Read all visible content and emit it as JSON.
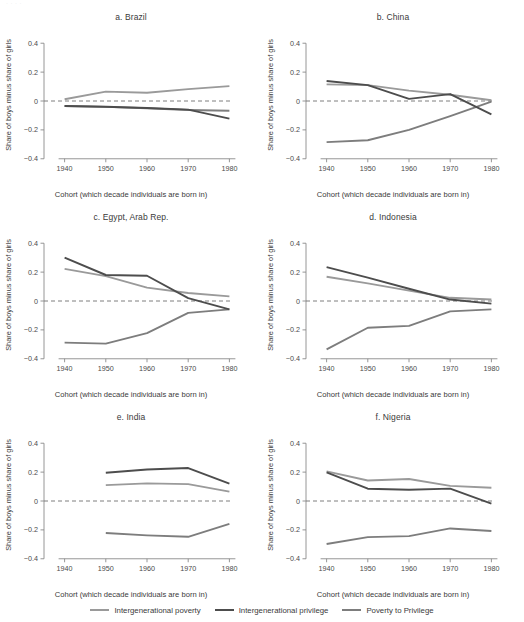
{
  "figure": {
    "top_remnant": "·  ·   ·   ·",
    "xlabel": "Cohort (which decade individuals are born in)",
    "ylabel": "Share of boys minus share of girls",
    "yticks": [
      "0.4",
      "0.2",
      "0",
      "−0.2",
      "−0.4"
    ],
    "ytick_values": [
      0.4,
      0.2,
      0,
      -0.2,
      -0.4
    ],
    "xticks": [
      "1940",
      "1950",
      "1960",
      "1970",
      "1980"
    ],
    "xtick_values": [
      1940,
      1950,
      1960,
      1970,
      1980
    ]
  },
  "legend": {
    "position": "bottom-center",
    "items": [
      {
        "label": "Intergenerational poverty",
        "color": "#9a9a9a"
      },
      {
        "label": "Intergenerational privilege",
        "color": "#4d4d4d"
      },
      {
        "label": "Poverty to Privilege",
        "color": "#7d7d7d"
      }
    ]
  },
  "chart_data": [
    {
      "type": "line",
      "title": "a. Brazil",
      "xlabel": "Cohort (which decade individuals are born in)",
      "ylabel": "Share of boys minus share of girls",
      "x": [
        1940,
        1950,
        1960,
        1970,
        1980
      ],
      "xlim": [
        1935,
        1985
      ],
      "ylim": [
        -0.45,
        0.45
      ],
      "grid": false,
      "zero_reference_line": 0,
      "series": [
        {
          "name": "Intergenerational poverty",
          "color": "#9a9a9a",
          "values": [
            0.012,
            0.065,
            0.057,
            0.082,
            0.103
          ]
        },
        {
          "name": "Intergenerational privilege",
          "color": "#4d4d4d",
          "values": [
            -0.035,
            -0.04,
            -0.048,
            -0.06,
            -0.122
          ]
        },
        {
          "name": "Poverty to Privilege",
          "color": "#7d7d7d",
          "values": [
            -0.035,
            -0.041,
            -0.05,
            -0.062,
            -0.068
          ]
        }
      ]
    },
    {
      "type": "line",
      "title": "b. China",
      "xlabel": "Cohort (which decade individuals are born in)",
      "ylabel": "Share of boys minus share of girls",
      "x": [
        1940,
        1950,
        1960,
        1970,
        1980
      ],
      "xlim": [
        1935,
        1985
      ],
      "ylim": [
        -0.45,
        0.45
      ],
      "grid": false,
      "zero_reference_line": 0,
      "series": [
        {
          "name": "Intergenerational poverty",
          "color": "#9a9a9a",
          "values": [
            0.115,
            0.11,
            0.072,
            0.043,
            0.005
          ]
        },
        {
          "name": "Intergenerational privilege",
          "color": "#4d4d4d",
          "values": [
            0.138,
            0.11,
            0.015,
            0.048,
            -0.092
          ]
        },
        {
          "name": "Poverty to Privilege",
          "color": "#7d7d7d",
          "values": [
            -0.285,
            -0.272,
            -0.2,
            -0.105,
            -0.005
          ]
        }
      ]
    },
    {
      "type": "line",
      "title": "c. Egypt, Arab Rep.",
      "xlabel": "Cohort (which decade individuals are born in)",
      "ylabel": "Share of boys minus share of girls",
      "x": [
        1940,
        1950,
        1960,
        1970,
        1980
      ],
      "xlim": [
        1935,
        1985
      ],
      "ylim": [
        -0.45,
        0.45
      ],
      "grid": false,
      "zero_reference_line": 0,
      "series": [
        {
          "name": "Intergenerational poverty",
          "color": "#9a9a9a",
          "values": [
            0.222,
            0.172,
            0.093,
            0.055,
            0.032
          ]
        },
        {
          "name": "Intergenerational privilege",
          "color": "#4d4d4d",
          "values": [
            0.3,
            0.18,
            0.175,
            0.02,
            -0.058
          ]
        },
        {
          "name": "Poverty to Privilege",
          "color": "#7d7d7d",
          "values": [
            -0.288,
            -0.295,
            -0.222,
            -0.082,
            -0.058
          ]
        }
      ]
    },
    {
      "type": "line",
      "title": "d. Indonesia",
      "xlabel": "Cohort (which decade individuals are born in)",
      "ylabel": "Share of boys minus share of girls",
      "x": [
        1940,
        1950,
        1960,
        1970,
        1980
      ],
      "xlim": [
        1935,
        1985
      ],
      "ylim": [
        -0.45,
        0.45
      ],
      "grid": false,
      "zero_reference_line": 0,
      "series": [
        {
          "name": "Intergenerational poverty",
          "color": "#9a9a9a",
          "values": [
            0.168,
            0.122,
            0.072,
            0.022,
            0.01
          ]
        },
        {
          "name": "Intergenerational privilege",
          "color": "#4d4d4d",
          "values": [
            0.235,
            0.162,
            0.085,
            0.01,
            -0.018
          ]
        },
        {
          "name": "Poverty to Privilege",
          "color": "#7d7d7d",
          "values": [
            -0.335,
            -0.185,
            -0.172,
            -0.072,
            -0.058
          ]
        }
      ]
    },
    {
      "type": "line",
      "title": "e. India",
      "xlabel": "Cohort (which decade individuals are born in)",
      "ylabel": "Share of boys minus share of girls",
      "x": [
        1950,
        1960,
        1970,
        1980
      ],
      "xlim": [
        1935,
        1985
      ],
      "ylim": [
        -0.45,
        0.45
      ],
      "grid": false,
      "zero_reference_line": 0,
      "series": [
        {
          "name": "Intergenerational poverty",
          "color": "#9a9a9a",
          "values": [
            0.11,
            0.122,
            0.117,
            0.065
          ]
        },
        {
          "name": "Intergenerational privilege",
          "color": "#4d4d4d",
          "values": [
            0.196,
            0.218,
            0.228,
            0.12
          ]
        },
        {
          "name": "Poverty to Privilege",
          "color": "#7d7d7d",
          "values": [
            -0.222,
            -0.238,
            -0.248,
            -0.158
          ]
        }
      ]
    },
    {
      "type": "line",
      "title": "f. Nigeria",
      "xlabel": "Cohort (which decade individuals are born in)",
      "ylabel": "Share of boys minus share of girls",
      "x": [
        1940,
        1950,
        1960,
        1970,
        1980
      ],
      "xlim": [
        1935,
        1985
      ],
      "ylim": [
        -0.45,
        0.45
      ],
      "grid": false,
      "zero_reference_line": 0,
      "series": [
        {
          "name": "Intergenerational poverty",
          "color": "#9a9a9a",
          "values": [
            0.205,
            0.142,
            0.152,
            0.105,
            0.092
          ]
        },
        {
          "name": "Intergenerational privilege",
          "color": "#4d4d4d",
          "values": [
            0.198,
            0.085,
            0.078,
            0.086,
            -0.018
          ]
        },
        {
          "name": "Poverty to Privilege",
          "color": "#7d7d7d",
          "values": [
            -0.298,
            -0.25,
            -0.243,
            -0.19,
            -0.208
          ]
        }
      ]
    }
  ]
}
